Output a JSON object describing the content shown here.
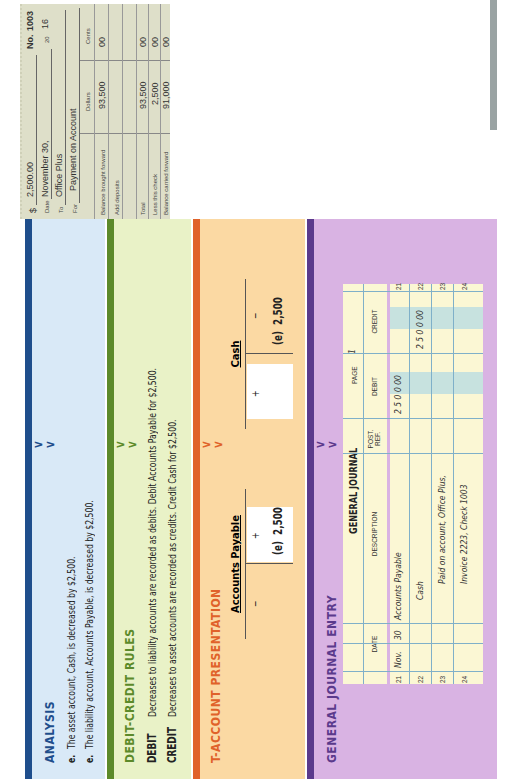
{
  "analysis": {
    "heading": "ANALYSIS",
    "lines": [
      {
        "marker": "e.",
        "text": "The asset account, Cash, is decreased by $2,500."
      },
      {
        "marker": "e.",
        "text": "The liability account, Accounts Payable, is decreased by $2,500."
      }
    ]
  },
  "debit_credit": {
    "heading": "DEBIT-CREDIT RULES",
    "debit_label": "DEBIT",
    "debit_text": "Decreases to liability accounts are recorded as debits. Debit Accounts Payable for $2,500.",
    "credit_label": "CREDIT",
    "credit_text": "Decreases to asset accounts are recorded as credits. Credit Cash for $2,500."
  },
  "t_account": {
    "heading": "T-ACCOUNT PRESENTATION",
    "accounts": [
      {
        "name": "Accounts Payable",
        "left_sign": "−",
        "right_sign": "+",
        "entry_side": "left",
        "entry_label": "(e)",
        "entry_value": "2,500"
      },
      {
        "name": "Cash",
        "left_sign": "+",
        "right_sign": "−",
        "entry_side": "right",
        "entry_label": "(e)",
        "entry_value": "2,500"
      }
    ]
  },
  "journal_entry": {
    "heading": "GENERAL JOURNAL ENTRY",
    "title": "GENERAL JOURNAL",
    "page_label": "PAGE",
    "page_number": "1",
    "columns": [
      "DATE",
      "DESCRIPTION",
      "POST. REF.",
      "DEBIT",
      "CREDIT"
    ],
    "rows": [
      {
        "line": "21",
        "month": "Nov.",
        "day": "30",
        "description": "Accounts Payable",
        "post_ref": "",
        "debit": "2 5 0 0 00",
        "credit": ""
      },
      {
        "line": "22",
        "month": "",
        "day": "",
        "description": "Cash",
        "post_ref": "",
        "debit": "",
        "credit": "2 5 0 0 00"
      },
      {
        "line": "23",
        "month": "",
        "day": "",
        "description": "Paid on account, Office Plus,",
        "post_ref": "",
        "debit": "",
        "credit": ""
      },
      {
        "line": "24",
        "month": "",
        "day": "",
        "description": "Invoice 2223, Check 1003",
        "post_ref": "",
        "debit": "",
        "credit": ""
      }
    ]
  },
  "check_stub": {
    "amount_label": "$",
    "amount": "2,500.00",
    "number_label": "No.",
    "number": "1003",
    "date_label": "Date",
    "date": "November 30,",
    "year_prefix": "20",
    "year": "16",
    "to_label": "To",
    "to": "Office Plus",
    "for_label": "For",
    "for": "Payment on Account",
    "col_dollars": "Dollars",
    "col_cents": "Cents",
    "rows": [
      {
        "label": "Balance brought forward",
        "dollars": "93,500",
        "cents": "00"
      },
      {
        "label": "Add deposits",
        "dollars": "",
        "cents": ""
      },
      {
        "label": "",
        "dollars": "",
        "cents": ""
      },
      {
        "label": "Total",
        "dollars": "93,500",
        "cents": "00"
      },
      {
        "label": "Less this check",
        "dollars": "2,500",
        "cents": "00"
      },
      {
        "label": "Balance carried forward",
        "dollars": "91,000",
        "cents": "00"
      }
    ]
  },
  "colors": {
    "analysis": "#1f4e8c",
    "debit_credit": "#5c8a2a",
    "t_account": "#e0622a",
    "journal": "#5b3a8c"
  }
}
